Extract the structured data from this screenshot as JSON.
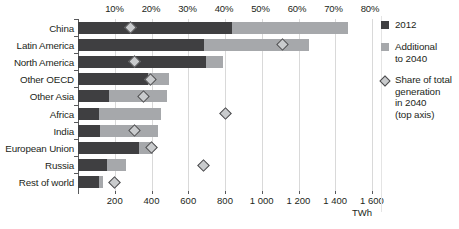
{
  "chart_data": {
    "type": "bar",
    "orientation": "horizontal",
    "stacked": true,
    "title": "",
    "xlabel": "TWh",
    "ylabel": "",
    "grid": true,
    "legend_position": "right",
    "categories": [
      "China",
      "Latin America",
      "North America",
      "Other OECD",
      "Other Asia",
      "Africa",
      "India",
      "European Union",
      "Russia",
      "Rest of world"
    ],
    "series": [
      {
        "name": "2012",
        "color": "#3f3f41",
        "values": [
          838,
          686,
          696,
          381,
          169,
          114,
          120,
          332,
          157,
          113
        ]
      },
      {
        "name": "Additional to 2040",
        "color": "#a6a8ab",
        "values": [
          632,
          571,
          93,
          114,
          315,
          337,
          318,
          76,
          105,
          22
        ]
      },
      {
        "name": "Share of total generation in 2040 (top axis)",
        "color": "#c9cbcd",
        "marker": "diamond",
        "axis": "top",
        "unit": "%",
        "values": [
          14.5,
          55.9,
          15.5,
          19.9,
          17.9,
          40.5,
          15.4,
          20.2,
          34.5,
          10.1
        ]
      }
    ],
    "bottom_axis": {
      "label": "TWh",
      "ticks": [
        0,
        200,
        400,
        600,
        800,
        1000,
        1200,
        1400,
        1600
      ],
      "tick_labels": [
        "",
        "200",
        "400",
        "600",
        "800",
        "1 000",
        "1 200",
        "1 400",
        "1 600"
      ],
      "min": 0,
      "max": 1600
    },
    "top_axis": {
      "ticks": [
        10,
        20,
        30,
        40,
        50,
        60,
        70,
        80
      ],
      "tick_labels": [
        "10%",
        "20%",
        "30%",
        "40%",
        "50%",
        "60%",
        "70%",
        "80%"
      ],
      "min": 0,
      "max": 80
    }
  },
  "legend": {
    "items": [
      {
        "label": "2012",
        "marker": "square-dark"
      },
      {
        "label": "Additional\nto 2040",
        "marker": "square-light"
      },
      {
        "label": "Share of total\ngeneration\nin 2040\n(top axis)",
        "marker": "diamond"
      }
    ]
  },
  "colors": {
    "series_2012": "#3f3f41",
    "series_additional": "#a6a8ab",
    "marker_share": "#c9cbcd",
    "gridline": "#d9d9d9",
    "axis": "#58595b",
    "text": "#231f20",
    "background": "#ffffff"
  }
}
